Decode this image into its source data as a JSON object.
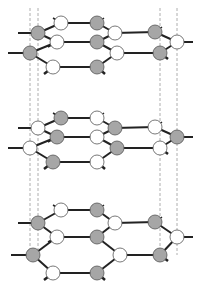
{
  "figure": {
    "colors": {
      "gray_atom": "#a6a6a6",
      "white_atom": "#ffffff",
      "atom_outline": "#555555",
      "bond": "#222222",
      "guide_line": "#999999"
    },
    "guides_x": [
      30,
      38,
      160,
      177
    ],
    "layers": [
      {
        "name": "layer-1",
        "dy": 0,
        "atoms": [
          {
            "x": 61,
            "y": 23,
            "c": "w"
          },
          {
            "x": 97,
            "y": 23,
            "c": "g"
          },
          {
            "x": 38,
            "y": 33,
            "c": "g"
          },
          {
            "x": 115,
            "y": 33,
            "c": "w"
          },
          {
            "x": 155,
            "y": 32,
            "c": "g"
          },
          {
            "x": 57,
            "y": 42,
            "c": "w"
          },
          {
            "x": 97,
            "y": 42,
            "c": "g"
          },
          {
            "x": 177,
            "y": 42,
            "c": "w"
          },
          {
            "x": 30,
            "y": 53,
            "c": "g"
          },
          {
            "x": 117,
            "y": 53,
            "c": "w"
          },
          {
            "x": 160,
            "y": 53,
            "c": "g"
          },
          {
            "x": 53,
            "y": 67,
            "c": "w"
          },
          {
            "x": 97,
            "y": 67,
            "c": "g"
          }
        ]
      },
      {
        "name": "layer-2",
        "dy": 95,
        "atoms": [
          {
            "x": 61,
            "y": 23,
            "c": "g"
          },
          {
            "x": 97,
            "y": 23,
            "c": "w"
          },
          {
            "x": 38,
            "y": 33,
            "c": "w"
          },
          {
            "x": 115,
            "y": 33,
            "c": "g"
          },
          {
            "x": 155,
            "y": 32,
            "c": "w"
          },
          {
            "x": 57,
            "y": 42,
            "c": "g"
          },
          {
            "x": 97,
            "y": 42,
            "c": "w"
          },
          {
            "x": 177,
            "y": 42,
            "c": "g"
          },
          {
            "x": 30,
            "y": 53,
            "c": "w"
          },
          {
            "x": 117,
            "y": 53,
            "c": "g"
          },
          {
            "x": 160,
            "y": 53,
            "c": "w"
          },
          {
            "x": 53,
            "y": 67,
            "c": "g"
          },
          {
            "x": 97,
            "y": 67,
            "c": "w"
          }
        ]
      },
      {
        "name": "layer-3",
        "dy": 195,
        "atoms": [
          {
            "x": 61,
            "y": 15,
            "c": "w"
          },
          {
            "x": 97,
            "y": 15,
            "c": "g"
          },
          {
            "x": 38,
            "y": 28,
            "c": "g"
          },
          {
            "x": 115,
            "y": 28,
            "c": "w"
          },
          {
            "x": 155,
            "y": 27,
            "c": "g"
          },
          {
            "x": 57,
            "y": 42,
            "c": "w"
          },
          {
            "x": 97,
            "y": 42,
            "c": "g"
          },
          {
            "x": 177,
            "y": 42,
            "c": "w"
          },
          {
            "x": 33,
            "y": 60,
            "c": "g"
          },
          {
            "x": 120,
            "y": 60,
            "c": "w"
          },
          {
            "x": 160,
            "y": 60,
            "c": "g"
          },
          {
            "x": 53,
            "y": 78,
            "c": "w"
          },
          {
            "x": 97,
            "y": 78,
            "c": "g"
          }
        ]
      }
    ]
  }
}
